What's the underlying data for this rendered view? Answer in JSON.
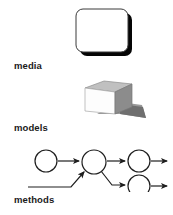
{
  "page": {
    "width": 173,
    "height": 215,
    "background": "#ffffff"
  },
  "sections": [
    {
      "id": "media",
      "label": "media",
      "figure": "rounded-rectangle-screen",
      "description": "white rounded rectangle with thin dark outline and hard black drop shadow offset down-right"
    },
    {
      "id": "models",
      "label": "models",
      "figure": "three-dimensional-cube",
      "description": "isometric cube with white left face, gray top face, dark gray right face and gray cast shadow to the lower right"
    },
    {
      "id": "methods",
      "label": "methods",
      "figure": "node-arrow-network",
      "description": "five-node directed flow graph with arrows; one source circle feeds a hub, a second line enters the hub from lower left, hub branches to an upper circle and a lower circle, each exiting right"
    }
  ],
  "colors": {
    "text": "#1a1a1a",
    "outline": "#333333",
    "shadow_black": "#000000",
    "cube_face_left": "#fdfdfd",
    "cube_face_top": "#b4b4b4",
    "cube_face_right": "#8c8c8c",
    "cube_shadow": "#9a9a9a",
    "background": "#ffffff"
  },
  "methods_graph": {
    "nodes": [
      {
        "id": "n1",
        "cx": 22,
        "cy": 21,
        "r": 11,
        "role": "source"
      },
      {
        "id": "n2",
        "cx": 70,
        "cy": 22,
        "r": 12,
        "role": "hub"
      },
      {
        "id": "n3",
        "cx": 115,
        "cy": 21,
        "r": 11,
        "role": "branch-upper"
      },
      {
        "id": "n4",
        "cx": 115,
        "cy": 46,
        "r": 11,
        "role": "branch-lower"
      }
    ],
    "edges": [
      {
        "from": "n1",
        "to": "n2",
        "type": "arrow"
      },
      {
        "from": "external-lower-left",
        "to": "n2",
        "type": "arrow"
      },
      {
        "from": "n2",
        "to": "n3",
        "type": "arrow"
      },
      {
        "from": "n2",
        "to": "n4",
        "type": "arrow"
      },
      {
        "from": "n3",
        "to": "exit-right",
        "type": "arrow"
      },
      {
        "from": "n4",
        "to": "exit-right",
        "type": "arrow"
      }
    ]
  }
}
